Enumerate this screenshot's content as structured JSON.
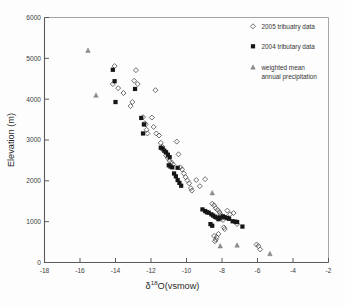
{
  "chart_data": {
    "type": "scatter",
    "title": "",
    "xlabel": "δ¹⁸O(vsmow)",
    "xlabel_parts": {
      "delta": "δ",
      "sup": "18",
      "rest": "O(vsmow)"
    },
    "ylabel": "Elevation (m)",
    "xlim": [
      -18,
      -2
    ],
    "ylim": [
      0,
      6000
    ],
    "xticks": [
      -18,
      -16,
      -14,
      -12,
      -10,
      -8,
      -6,
      -4,
      -2
    ],
    "yticks": [
      0,
      1000,
      2000,
      3000,
      4000,
      5000,
      6000
    ],
    "grid": false,
    "legend_position": "top-right",
    "series": [
      {
        "name": "2005 tribuatry data",
        "marker": "open-diamond",
        "color": "#4a4a4a",
        "points": [
          [
            -14.05,
            4810
          ],
          [
            -14.15,
            4370
          ],
          [
            -13.55,
            4150
          ],
          [
            -13.85,
            4270
          ],
          [
            -12.85,
            4710
          ],
          [
            -12.95,
            4450
          ],
          [
            -13.05,
            3930
          ],
          [
            -13.15,
            3830
          ],
          [
            -12.75,
            4370
          ],
          [
            -12.45,
            3560
          ],
          [
            -12.35,
            3410
          ],
          [
            -12.3,
            3380
          ],
          [
            -12.25,
            3250
          ],
          [
            -12.2,
            3160
          ],
          [
            -11.95,
            3550
          ],
          [
            -11.75,
            4220
          ],
          [
            -11.85,
            3320
          ],
          [
            -11.7,
            3160
          ],
          [
            -11.55,
            3110
          ],
          [
            -11.45,
            2930
          ],
          [
            -11.35,
            2830
          ],
          [
            -11.25,
            2720
          ],
          [
            -11.15,
            2620
          ],
          [
            -11.05,
            2560
          ],
          [
            -10.95,
            2490
          ],
          [
            -10.85,
            2450
          ],
          [
            -10.75,
            2400
          ],
          [
            -10.55,
            2960
          ],
          [
            -10.45,
            2650
          ],
          [
            -10.35,
            2330
          ],
          [
            -10.25,
            2280
          ],
          [
            -10.15,
            2180
          ],
          [
            -10.05,
            2090
          ],
          [
            -9.95,
            2010
          ],
          [
            -9.85,
            1940
          ],
          [
            -9.75,
            1820
          ],
          [
            -9.7,
            1760
          ],
          [
            -9.45,
            2020
          ],
          [
            -9.25,
            1870
          ],
          [
            -8.95,
            2040
          ],
          [
            -8.55,
            1440
          ],
          [
            -8.45,
            1400
          ],
          [
            -8.35,
            1330
          ],
          [
            -8.25,
            1290
          ],
          [
            -8.15,
            1240
          ],
          [
            -8.1,
            1190
          ],
          [
            -8.05,
            1140
          ],
          [
            -8.0,
            1090
          ],
          [
            -7.95,
            1040
          ],
          [
            -7.9,
            860
          ],
          [
            -7.85,
            820
          ],
          [
            -8.2,
            700
          ],
          [
            -8.3,
            620
          ],
          [
            -8.35,
            560
          ],
          [
            -8.4,
            520
          ],
          [
            -8.45,
            650
          ],
          [
            -7.7,
            1270
          ],
          [
            -7.55,
            1180
          ],
          [
            -7.35,
            1210
          ],
          [
            -7.15,
            940
          ],
          [
            -6.05,
            440
          ],
          [
            -5.95,
            400
          ],
          [
            -5.85,
            320
          ]
        ]
      },
      {
        "name": "2004 tributary data",
        "marker": "filled-square",
        "color": "#151515",
        "points": [
          [
            -14.15,
            4720
          ],
          [
            -14.05,
            4440
          ],
          [
            -14.0,
            3930
          ],
          [
            -12.9,
            4250
          ],
          [
            -12.55,
            3540
          ],
          [
            -12.4,
            3380
          ],
          [
            -12.45,
            3160
          ],
          [
            -11.45,
            2810
          ],
          [
            -11.35,
            2790
          ],
          [
            -11.25,
            2740
          ],
          [
            -11.15,
            2700
          ],
          [
            -11.05,
            2640
          ],
          [
            -10.95,
            2580
          ],
          [
            -11.0,
            2380
          ],
          [
            -10.9,
            2350
          ],
          [
            -10.8,
            2330
          ],
          [
            -10.5,
            2320
          ],
          [
            -10.7,
            2180
          ],
          [
            -10.6,
            2110
          ],
          [
            -10.5,
            2020
          ],
          [
            -10.4,
            1950
          ],
          [
            -10.3,
            1880
          ],
          [
            -9.1,
            1300
          ],
          [
            -8.95,
            1260
          ],
          [
            -8.85,
            1230
          ],
          [
            -8.75,
            1220
          ],
          [
            -8.6,
            1180
          ],
          [
            -8.5,
            1150
          ],
          [
            -8.4,
            1120
          ],
          [
            -8.3,
            1100
          ],
          [
            -8.2,
            1060
          ],
          [
            -8.1,
            1100
          ],
          [
            -7.95,
            1130
          ],
          [
            -7.85,
            1110
          ],
          [
            -7.7,
            1090
          ],
          [
            -7.6,
            1070
          ],
          [
            -7.4,
            1010
          ],
          [
            -7.25,
            1000
          ],
          [
            -7.15,
            990
          ],
          [
            -6.85,
            880
          ],
          [
            -8.55,
            900
          ],
          [
            -8.65,
            940
          ]
        ]
      },
      {
        "name": "weighted mean annual precipitation",
        "marker": "filled-triangle",
        "color": "#8e8e8e",
        "points": [
          [
            -15.55,
            5190
          ],
          [
            -15.1,
            4090
          ],
          [
            -8.55,
            1700
          ],
          [
            -8.1,
            400
          ],
          [
            -7.15,
            420
          ],
          [
            -5.3,
            210
          ]
        ]
      }
    ]
  },
  "legend": {
    "items": [
      {
        "label": "2005 tribuatry data",
        "marker": "open-diamond"
      },
      {
        "label": "2004 tributary data",
        "marker": "filled-square"
      },
      {
        "label": "weighted mean",
        "label2": "annual precipitation",
        "marker": "filled-triangle"
      }
    ]
  },
  "colors": {
    "axis": "#5a5a5a",
    "text": "#333333",
    "open_marker": "#4a4a4a",
    "solid_marker": "#151515",
    "triangle_marker": "#8e8e8e",
    "background": "#fdfdfd"
  }
}
